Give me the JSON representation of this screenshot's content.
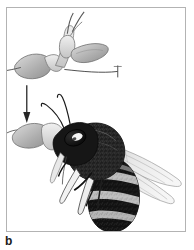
{
  "figure": {
    "panel_label": "b",
    "caption_visible": false,
    "frame": {
      "border_color": "#b3b3b3",
      "background_color": "#ffffff"
    },
    "colors": {
      "ink_black": "#1a1a1a",
      "pollinium_fill": "#a8a8a8",
      "pollinium_light": "#d8d8d8",
      "wing_fill": "#e2e2e2",
      "wing_vein": "#8c8c8c",
      "arrow": "#262626",
      "frame": "#b3b3b3",
      "paper": "#ffffff"
    },
    "elements": [
      {
        "id": "pollinarium-detached",
        "name": "orchid-pollinarium",
        "position": "top-left",
        "description": "Detached orchid pollinarium with two pollinia masses, caudicles and viscidium, drawn in light gray line art"
      },
      {
        "id": "transfer-arrow",
        "name": "downward-arrow",
        "position": "left-middle",
        "direction": "down",
        "description": "Thin vertical arrow pointing down indicating attachment sequence"
      },
      {
        "id": "bee-with-pollinarium",
        "name": "bee-carrying-pollinarium",
        "position": "lower-right",
        "description": "Side view of a hairy bee with banded abdomen, large compound eye, two antennae and two translucent wings, carrying the pollinarium attached to its head"
      }
    ]
  }
}
